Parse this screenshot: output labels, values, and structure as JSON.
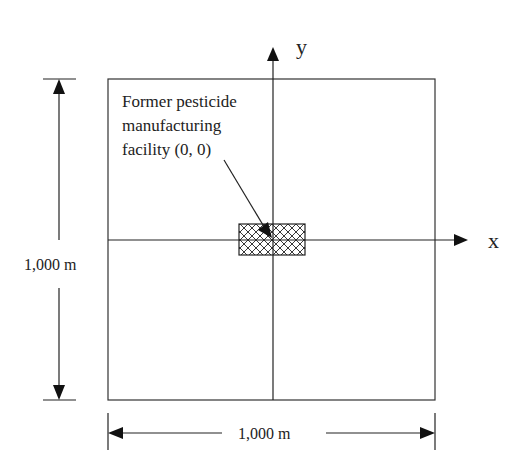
{
  "diagram": {
    "axis_labels": {
      "x": "x",
      "y": "y"
    },
    "facility_label": {
      "lines": [
        "Former pesticide",
        "manufacturing",
        "facility (0, 0)"
      ]
    },
    "dimensions": {
      "vertical": "1,000 m",
      "horizontal": "1,000 m"
    },
    "colors": {
      "line": "#222222",
      "background": "#ffffff"
    }
  }
}
